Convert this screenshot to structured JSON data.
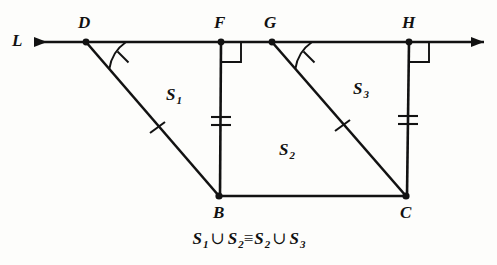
{
  "figure": {
    "ink_color": "#121212",
    "background_color": "#fdfdfb"
  },
  "line": {
    "name": "L",
    "label": "L",
    "arrow_left": true,
    "arrow_right": true
  },
  "points": [
    {
      "id": "D",
      "label": "D",
      "x": 86,
      "y": 42,
      "label_x": 78,
      "label_y": 14
    },
    {
      "id": "F",
      "label": "F",
      "x": 221,
      "y": 42,
      "label_x": 214,
      "label_y": 14
    },
    {
      "id": "G",
      "label": "G",
      "x": 272,
      "y": 42,
      "label_x": 264,
      "label_y": 14
    },
    {
      "id": "H",
      "label": "H",
      "x": 409,
      "y": 42,
      "label_x": 402,
      "label_y": 14
    },
    {
      "id": "B",
      "label": "B",
      "x": 219,
      "y": 196,
      "label_x": 213,
      "label_y": 204
    },
    {
      "id": "C",
      "label": "C",
      "x": 406,
      "y": 196,
      "label_x": 400,
      "label_y": 204
    }
  ],
  "regions": [
    {
      "id": "S1",
      "letter": "S",
      "subscript": "1",
      "x": 166,
      "y": 86
    },
    {
      "id": "S2",
      "letter": "S",
      "subscript": "2",
      "x": 279,
      "y": 141
    },
    {
      "id": "S3",
      "letter": "S",
      "subscript": "3",
      "x": 353,
      "y": 80
    }
  ],
  "marks": {
    "right_angles": [
      "F",
      "H"
    ],
    "angle_arcs": [
      "D",
      "G"
    ],
    "single_ticks": [
      "DB",
      "GC"
    ],
    "double_ticks": [
      "FB",
      "HC"
    ]
  },
  "caption": {
    "full_text": "S1 ∪ S2 ≡ S2 ∪ S3",
    "s_letter": "S",
    "sub_1": "1",
    "sub_2": "2",
    "sub_2b": "2",
    "sub_3": "3",
    "union_symbol": "∪",
    "congruent_symbol": "≡"
  }
}
